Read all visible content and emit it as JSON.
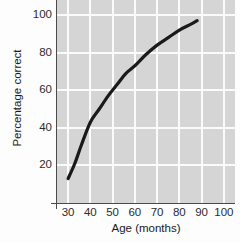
{
  "chart_data": {
    "type": "line",
    "title": "",
    "xlabel": "Age (months)",
    "ylabel": "Percentage correct",
    "xlim": [
      25,
      105
    ],
    "ylim": [
      0,
      108
    ],
    "grid": true,
    "legend_position": "none",
    "xticks": [
      30,
      40,
      50,
      60,
      70,
      80,
      90,
      100
    ],
    "yticks": [
      20,
      40,
      60,
      80,
      100
    ],
    "xtick_labels": [
      "30",
      "40",
      "50",
      "60",
      "70",
      "80",
      "90",
      "100"
    ],
    "ytick_labels": [
      "20",
      "40",
      "60",
      "80",
      "100"
    ],
    "series": [
      {
        "name": "Percentage correct by age",
        "color": "#1a1a1a",
        "line_width": 3.2,
        "x": [
          30,
          33,
          36,
          40,
          44,
          48,
          52,
          56,
          60,
          65,
          70,
          75,
          80,
          85,
          88
        ],
        "values": [
          13,
          21,
          31,
          43,
          50,
          57,
          63,
          69,
          73,
          79,
          84,
          88,
          92,
          95,
          97
        ]
      }
    ],
    "plot_background": "#d5d5d5",
    "gridline_color": "#fbfbfb",
    "axis_color": "#4a4a4a",
    "page_background": "#fdfdfd"
  }
}
